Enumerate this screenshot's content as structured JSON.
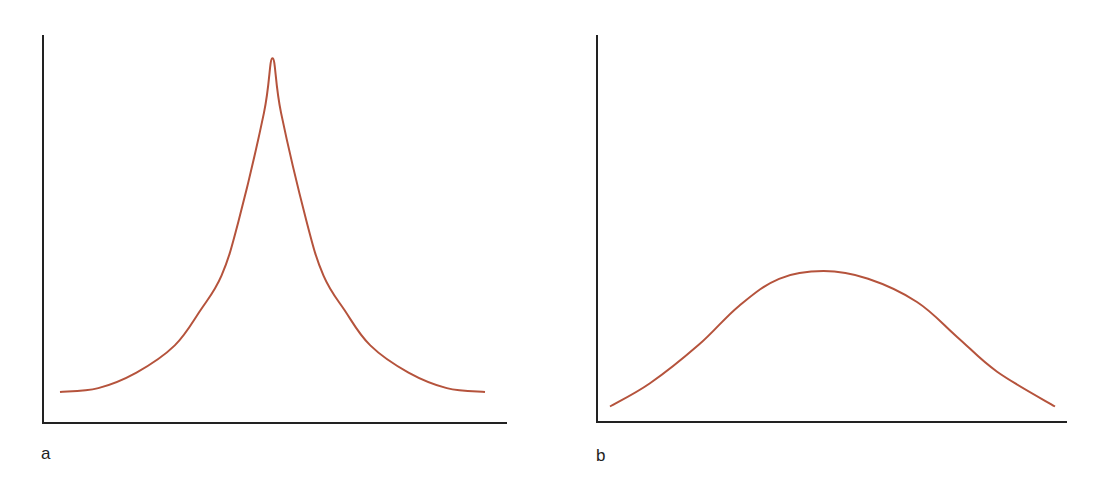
{
  "page": {
    "background": "#ffffff",
    "curve_color": "#b5533c",
    "axis_color": "#222222"
  },
  "chart_data": [
    {
      "type": "line",
      "panel_label": "a",
      "title": "",
      "xlabel": "",
      "ylabel": "",
      "grid": false,
      "legend": null,
      "description": "Leptokurtic (sharply peaked) symmetric distribution curve",
      "x": [
        0.0,
        0.09,
        0.18,
        0.27,
        0.33,
        0.38,
        0.42,
        0.48,
        0.5,
        0.52,
        0.58,
        0.62,
        0.67,
        0.73,
        0.82,
        0.91,
        1.0
      ],
      "values": [
        0.08,
        0.09,
        0.13,
        0.2,
        0.29,
        0.38,
        0.52,
        0.8,
        0.94,
        0.8,
        0.52,
        0.38,
        0.29,
        0.2,
        0.13,
        0.09,
        0.08
      ],
      "ylim": [
        0,
        1
      ],
      "xlim": [
        0,
        1
      ]
    },
    {
      "type": "line",
      "panel_label": "b",
      "title": "",
      "xlabel": "",
      "ylabel": "",
      "grid": false,
      "legend": null,
      "description": "Platykurtic (flat, broad) symmetric distribution curve",
      "x": [
        0.0,
        0.09,
        0.2,
        0.29,
        0.38,
        0.48,
        0.58,
        0.69,
        0.78,
        0.87,
        1.0
      ],
      "values": [
        0.04,
        0.1,
        0.2,
        0.3,
        0.37,
        0.39,
        0.37,
        0.31,
        0.22,
        0.13,
        0.04
      ],
      "ylim": [
        0,
        1
      ],
      "xlim": [
        0,
        1
      ]
    }
  ],
  "panels": {
    "a": {
      "label": "a"
    },
    "b": {
      "label": "b"
    }
  }
}
